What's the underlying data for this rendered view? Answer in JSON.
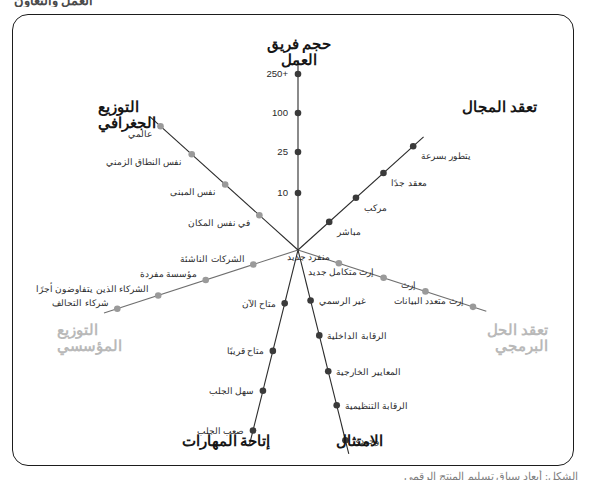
{
  "page": {
    "top_cut_text": "العمل والتعاون",
    "bottom_cut_text": "الشكل: أبعاد سياق تسليم المنتج الرقمي"
  },
  "colors": {
    "frame": "#1d1d1d",
    "axis_dark": "#2b2b2b",
    "axis_gray": "#9a9a9a",
    "dot_dark": "#3a3a3a",
    "dot_gray": "#9a9a9a",
    "title_dark": "#161616",
    "title_muted": "#b9b9b9",
    "background": "#ffffff"
  },
  "chart_data": {
    "type": "radar",
    "title": "أبعاد سياق تسليم المنتج الرقمي",
    "center": {
      "x": 298,
      "y": 250
    },
    "grid": false,
    "legend": null,
    "axes": [
      {
        "id": "team-size",
        "title": "حجم فريق العمل",
        "title_lines": "حجم فريق العمل",
        "emphasis": "dark",
        "angle_deg": 90,
        "dot_color": "#3a3a3a",
        "line_color": "#2b2b2b",
        "scale_side": true,
        "ticks": [
          {
            "label": "250+",
            "r": 176
          },
          {
            "label": "100",
            "r": 137
          },
          {
            "label": "25",
            "r": 98
          },
          {
            "label": "10",
            "r": 57
          }
        ]
      },
      {
        "id": "domain-complexity",
        "title": "تعقد المجال",
        "title_lines": "تعقد المجال",
        "emphasis": "dark",
        "angle_deg": 42,
        "dot_color": "#3a3a3a",
        "line_color": "#2b2b2b",
        "scale_side": false,
        "ticks": [
          {
            "label": "يتطور بسرعة",
            "r": 155
          },
          {
            "label": "معقد جدًا",
            "r": 115
          },
          {
            "label": "مركب",
            "r": 78
          },
          {
            "label": "مباشر",
            "r": 42
          }
        ]
      },
      {
        "id": "software-complexity",
        "title": "تعقد الحل\nالبرمجي",
        "title_lines": "تعقد الحل\nالبرمجي",
        "emphasis": "muted",
        "angle_deg": -18,
        "dot_color": "#9a9a9a",
        "line_color": "#6f6f6f",
        "scale_side": false,
        "ticks": [
          {
            "label": "منفرد جديد",
            "r": 43
          },
          {
            "label": "إرث متكامل جديد",
            "r": 90
          },
          {
            "label": "إرث",
            "r": 134
          },
          {
            "label": "إرث متعدد البيانات",
            "r": 184
          }
        ]
      },
      {
        "id": "compliance",
        "title": "الامتثال",
        "title_lines": "الامتثال",
        "emphasis": "dark",
        "angle_deg": -76,
        "dot_color": "#3a3a3a",
        "line_color": "#2b2b2b",
        "scale_side": false,
        "ticks": [
          {
            "label": "غير الرسمي",
            "r": 52
          },
          {
            "label": "الرقابة الداخلية",
            "r": 88
          },
          {
            "label": "المعايير الخارجية",
            "r": 125
          },
          {
            "label": "الرقابة التنظيمية",
            "r": 160
          },
          {
            "label": "وجودي",
            "r": 196
          }
        ]
      },
      {
        "id": "skills-availability",
        "title": "إتاحة المهارات",
        "title_lines": "إتاحة المهارات",
        "emphasis": "dark",
        "angle_deg": -104,
        "dot_color": "#3a3a3a",
        "line_color": "#2b2b2b",
        "scale_side": false,
        "ticks": [
          {
            "label": "متاح الآن",
            "r": 55
          },
          {
            "label": "متاح قريبًا",
            "r": 104
          },
          {
            "label": "سهل الجلب",
            "r": 145
          },
          {
            "label": "صعب الجلب",
            "r": 186
          }
        ]
      },
      {
        "id": "organizational-distribution",
        "title": "التوزيع\nالمؤسسي",
        "title_lines": "التوزيع\nالمؤسسي",
        "emphasis": "muted",
        "angle_deg": 198,
        "dot_color": "#9a9a9a",
        "line_color": "#6f6f6f",
        "scale_side": false,
        "ticks": [
          {
            "label": "الشركات الناشئة",
            "r": 47
          },
          {
            "label": "مؤسسة مفردة",
            "r": 97
          },
          {
            "label": "الشركاء الذين يتفاوضون أجرًا",
            "r": 147
          },
          {
            "label": "شركاء التحالف",
            "r": 190
          }
        ]
      },
      {
        "id": "geographic-distribution",
        "title": "التوزيع\nالجغرافي",
        "title_lines": "التوزيع\nالجغرافي",
        "emphasis": "dark",
        "angle_deg": 138,
        "dot_color": "#9a9a9a",
        "line_color": "#2b2b2b",
        "scale_side": false,
        "ticks": [
          {
            "label": "في نفس المكان",
            "r": 52
          },
          {
            "label": "نفس المبنى",
            "r": 98
          },
          {
            "label": "نفس النطاق الزمني",
            "r": 143
          },
          {
            "label": "عالمي",
            "r": 185
          }
        ]
      }
    ]
  },
  "label_positions": {
    "titles": [
      {
        "axis": "team-size",
        "left": 251,
        "top": 36,
        "align": "center",
        "width": 96
      },
      {
        "axis": "domain-complexity",
        "left": 441,
        "top": 99,
        "align": "right",
        "width": 96
      },
      {
        "axis": "software-complexity",
        "left": 452,
        "top": 322,
        "align": "right",
        "width": 96
      },
      {
        "axis": "compliance",
        "left": 324,
        "top": 433,
        "align": "center",
        "width": 70
      },
      {
        "axis": "skills-availability",
        "left": 170,
        "top": 433,
        "align": "center",
        "width": 112
      },
      {
        "axis": "organizational-distribution",
        "left": 57,
        "top": 322,
        "align": "left",
        "width": 96
      },
      {
        "axis": "geographic-distribution",
        "left": 98,
        "top": 99,
        "align": "left",
        "width": 96
      }
    ]
  }
}
